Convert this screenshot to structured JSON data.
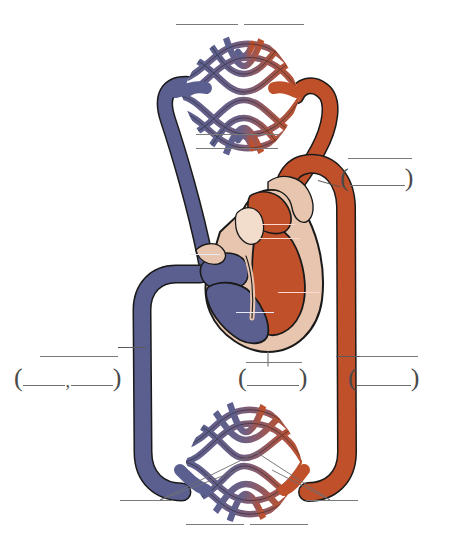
{
  "diagram": {
    "type": "double circulation schematic",
    "colors": {
      "deoxygenated_blue": "#5b5f8f",
      "oxygenated_red": "#c0502a",
      "myocardium_tan": "#e8c5ae",
      "capillary_blend_purple": "#7d5f77",
      "outline": "#1a1a1a",
      "rule_gray": "#7a7a7a",
      "white_label_rule": "#ffffff",
      "background": "#ffffff"
    },
    "regions": [
      {
        "name": "pulmonary-capillary-bed",
        "position": "top",
        "description": "lung capillary network, blue entering from left, red leaving to right"
      },
      {
        "name": "heart",
        "position": "center",
        "description": "four-chambered heart, blue right side, red left side, tan myocardium"
      },
      {
        "name": "systemic-capillary-bed",
        "position": "bottom",
        "description": "body capillary network, red entering from right, blue leaving to left"
      },
      {
        "name": "pulmonary-artery",
        "position": "left-upper",
        "description": "blue vessel from heart to lungs"
      },
      {
        "name": "pulmonary-vein",
        "position": "right-upper",
        "description": "red vessel from lungs to heart"
      },
      {
        "name": "aorta",
        "position": "right",
        "description": "red vessel descending to body"
      },
      {
        "name": "vena-cava",
        "position": "left",
        "description": "blue vessel returning from body"
      }
    ]
  },
  "answer_blanks": {
    "count": 16,
    "note": "All label lines are blank; no text is printed on the diagram.",
    "plain_rules": [
      {
        "id": "blank-top-left",
        "text": ""
      },
      {
        "id": "blank-top-right",
        "text": ""
      },
      {
        "id": "blank-upper-mid-1",
        "text": ""
      },
      {
        "id": "blank-upper-mid-2",
        "text": ""
      },
      {
        "id": "blank-left-middle",
        "text": ""
      },
      {
        "id": "blank-right-middle",
        "text": ""
      },
      {
        "id": "blank-center-lower",
        "text": ""
      },
      {
        "id": "blank-bottom-left",
        "text": ""
      },
      {
        "id": "blank-bottom-right",
        "text": ""
      },
      {
        "id": "blank-bottom-mid-1",
        "text": ""
      },
      {
        "id": "blank-bottom-mid-2",
        "text": ""
      }
    ],
    "white_rules_on_heart": [
      {
        "id": "white-blank-aortic-arch",
        "text": ""
      },
      {
        "id": "white-blank-right-atrium",
        "text": ""
      },
      {
        "id": "white-blank-left-ventricle",
        "text": ""
      },
      {
        "id": "white-blank-right-ventricle",
        "text": ""
      },
      {
        "id": "white-blank-upper-vessel",
        "text": ""
      }
    ],
    "paren_groups": [
      {
        "id": "paren-upper-right",
        "open": "(",
        "close": ")",
        "slots": 1,
        "separator": ""
      },
      {
        "id": "paren-left-middle",
        "open": "(",
        "close": ")",
        "slots": 2,
        "separator": ","
      },
      {
        "id": "paren-center-lower",
        "open": "(",
        "close": ")",
        "slots": 1,
        "separator": ""
      },
      {
        "id": "paren-right-middle",
        "open": "(",
        "close": ")",
        "slots": 1,
        "separator": ""
      }
    ]
  }
}
